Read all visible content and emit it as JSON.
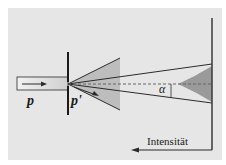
{
  "diagram": {
    "labels": {
      "momentum_in": "p",
      "momentum_out": "p'",
      "angle": "α",
      "intensity_axis": "Intensität"
    },
    "colors": {
      "background": "#e6e6e6",
      "line": "#2b2b2b",
      "cone_fill": "#bdbdbd",
      "intensity_fill": "#9a9a9a",
      "beam_fill_start": "#f2f2f2",
      "beam_fill_end": "#cfcfcf",
      "dashed_axis": "#666666"
    },
    "elements": [
      "incoming-beam",
      "slit-barrier",
      "diffraction-cone",
      "outer-ray-lines",
      "central-dashed-axis",
      "angle-alpha-marker",
      "detection-screen",
      "intensity-profile",
      "intensity-arrow"
    ]
  }
}
